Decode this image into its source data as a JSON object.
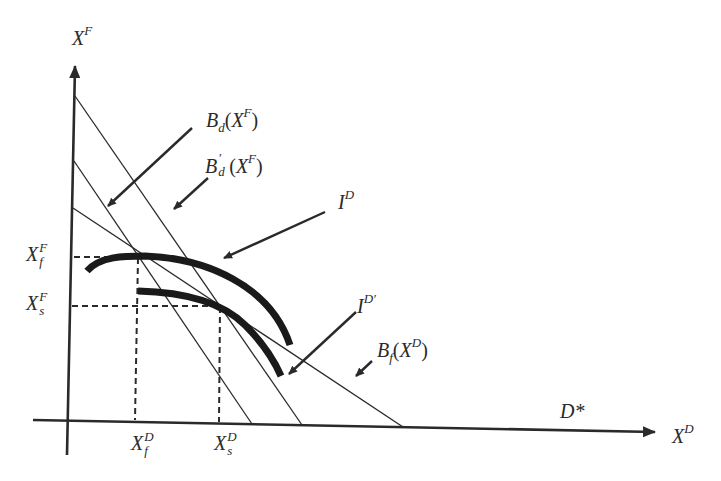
{
  "diagram": {
    "axes": {
      "y_label": {
        "base": "X",
        "sup": "F"
      },
      "x_label": {
        "base": "X",
        "sup": "D"
      }
    },
    "reaction_curves": [
      {
        "id": "Bd",
        "label": {
          "base": "B",
          "sub": "d",
          "arg_base": "X",
          "arg_sup": "F",
          "prime": ""
        }
      },
      {
        "id": "Bd_prime",
        "label": {
          "base": "B",
          "sub": "d",
          "arg_base": "X",
          "arg_sup": "F",
          "prime": "′"
        }
      },
      {
        "id": "Bf",
        "label": {
          "base": "B",
          "sub": "f",
          "arg_base": "X",
          "arg_sup": "D",
          "prime": ""
        }
      }
    ],
    "indifference_curves": [
      {
        "id": "ID",
        "label": {
          "base": "I",
          "sup": "D"
        }
      },
      {
        "id": "ID_prime",
        "label": {
          "base": "I",
          "sup": "D′"
        }
      }
    ],
    "y_ticks": [
      {
        "id": "Xf_F",
        "base": "X",
        "sup": "F",
        "sub": "f"
      },
      {
        "id": "Xs_F",
        "base": "X",
        "sup": "F",
        "sub": "s"
      }
    ],
    "x_ticks": [
      {
        "id": "Xf_D",
        "base": "X",
        "sup": "D",
        "sub": "f"
      },
      {
        "id": "Xs_D",
        "base": "X",
        "sup": "D",
        "sub": "s"
      }
    ],
    "region_label": "D*",
    "colors": {
      "line": "#2a2a2a",
      "background": "#ffffff"
    }
  }
}
